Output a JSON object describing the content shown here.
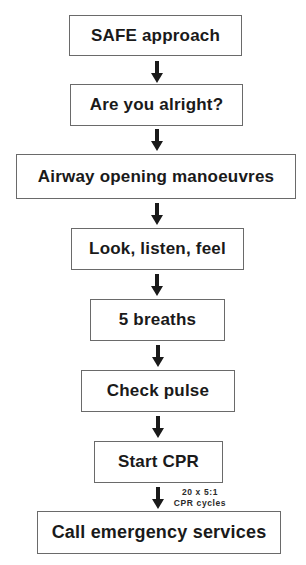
{
  "flowchart": {
    "steps": [
      {
        "label": "SAFE approach"
      },
      {
        "label": "Are you alright?"
      },
      {
        "label": "Airway opening manoeuvres"
      },
      {
        "label": "Look, listen, feel"
      },
      {
        "label": "5 breaths"
      },
      {
        "label": "Check pulse"
      },
      {
        "label": "Start CPR"
      },
      {
        "label": "Call emergency services"
      }
    ],
    "annotation": {
      "line1": "20 x 5:1",
      "line2": "CPR cycles"
    },
    "colors": {
      "box_border": "#6a6a6a",
      "arrow": "#1a1a1a",
      "text": "#1a1a1a",
      "background": "#ffffff"
    }
  }
}
